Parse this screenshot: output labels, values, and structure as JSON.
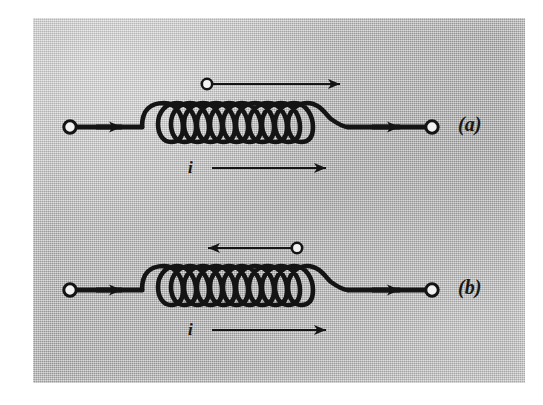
{
  "figure": {
    "kind": "physics-circuit-diagram",
    "background_color": "#b9b9b9",
    "ink_color": "#141414",
    "terminal_fill_color": "#f2f2f2",
    "paper_color": "#ffffff"
  },
  "diagrams": [
    {
      "id": "a",
      "label": "(a)",
      "label_x": 466,
      "label_y": 124,
      "axis_y": 127,
      "coil": {
        "turns": 9,
        "x_start": 142,
        "x_end": 348,
        "top_y": 103,
        "bottom_y": 142
      },
      "left_terminal": {
        "cx": 70,
        "cy": 127,
        "r": 6
      },
      "right_terminal": {
        "cx": 432,
        "cy": 127,
        "r": 6
      },
      "lead_arrows": [
        {
          "name": "left-lead-arrow",
          "direction": "right",
          "x": 110,
          "y": 127
        },
        {
          "name": "right-lead-arrow",
          "direction": "right",
          "x": 398,
          "y": 127
        }
      ],
      "field_arrow": {
        "name": "flux-arrow",
        "direction": "right",
        "circle_end": "left",
        "x_start": 206,
        "x_end": 344,
        "y": 84
      },
      "current_arrow": {
        "name": "current-arrow",
        "direction": "right",
        "x_start": 212,
        "x_end": 330,
        "y": 168
      },
      "current_label": "i",
      "current_label_x": 193,
      "current_label_y": 168
    },
    {
      "id": "b",
      "label": "(b)",
      "label_x": 466,
      "label_y": 287,
      "axis_y": 290,
      "coil": {
        "turns": 9,
        "x_start": 142,
        "x_end": 348,
        "top_y": 266,
        "bottom_y": 305
      },
      "left_terminal": {
        "cx": 70,
        "cy": 290,
        "r": 6
      },
      "right_terminal": {
        "cx": 432,
        "cy": 290,
        "r": 6
      },
      "lead_arrows": [
        {
          "name": "left-lead-arrow",
          "direction": "right",
          "x": 110,
          "y": 290
        },
        {
          "name": "right-lead-arrow",
          "direction": "right",
          "x": 398,
          "y": 290
        }
      ],
      "field_arrow": {
        "name": "flux-arrow",
        "direction": "left",
        "circle_end": "right",
        "x_start": 206,
        "x_end": 344,
        "y": 248
      },
      "current_arrow": {
        "name": "current-arrow",
        "direction": "right",
        "x_start": 212,
        "x_end": 330,
        "y": 330
      },
      "current_label": "i",
      "current_label_x": 193,
      "current_label_y": 330
    }
  ]
}
